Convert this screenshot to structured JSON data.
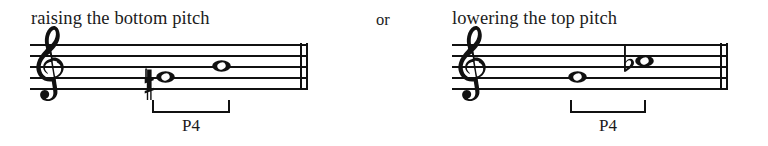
{
  "figure": {
    "connector_text": "or",
    "examples": [
      {
        "id": "raising-bottom-pitch",
        "caption": "raising the bottom pitch",
        "clef": "treble-clef",
        "barline": "double-barline",
        "notes": [
          {
            "name": "lower-note",
            "duration": "whole",
            "accidental": "sharp",
            "accidental_glyph": "♯",
            "staff_position": "space-1"
          },
          {
            "name": "upper-note",
            "duration": "whole",
            "accidental": "none",
            "accidental_glyph": "",
            "staff_position": "line-3"
          }
        ],
        "interval": {
          "label": "P4",
          "bracket": "interval-bracket"
        }
      },
      {
        "id": "lowering-top-pitch",
        "caption": "lowering the top pitch",
        "clef": "treble-clef",
        "barline": "double-barline",
        "notes": [
          {
            "name": "lower-note",
            "duration": "whole",
            "accidental": "none",
            "accidental_glyph": "",
            "staff_position": "space-2"
          },
          {
            "name": "upper-note",
            "duration": "whole",
            "accidental": "flat",
            "accidental_glyph": "♭",
            "staff_position": "line-4"
          }
        ],
        "interval": {
          "label": "P4",
          "bracket": "interval-bracket"
        }
      }
    ]
  },
  "colors": {
    "ink": "#111111",
    "text": "#1b1b1b",
    "background": "#ffffff"
  }
}
